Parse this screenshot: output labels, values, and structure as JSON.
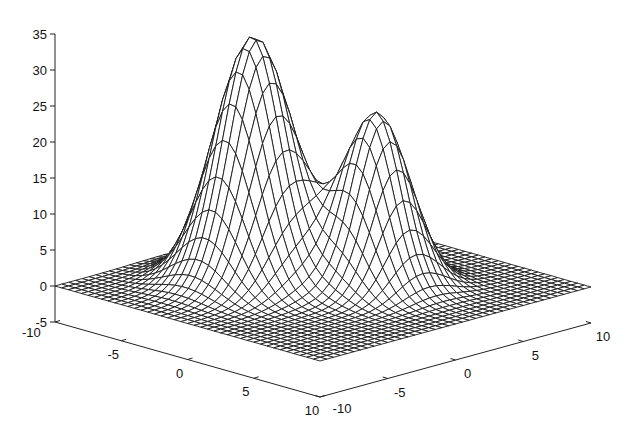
{
  "chart_data": {
    "type": "surface",
    "title": "",
    "xlabel": "",
    "ylabel": "",
    "zlabel": "",
    "x_ticks": [
      "-10",
      "-5",
      "0",
      "5",
      "10"
    ],
    "y_ticks": [
      "-10",
      "-5",
      "0",
      "5",
      "10"
    ],
    "z_ticks": [
      "35",
      "30",
      "25",
      "20",
      "15",
      "10",
      "5",
      "0",
      "-5"
    ],
    "xlim": [
      -10,
      10
    ],
    "ylim": [
      -10,
      10
    ],
    "zlim": [
      -5,
      35
    ],
    "grid": false,
    "style": "wireframe mesh, black lines on white",
    "mesh_resolution": 41,
    "surface": {
      "description": "Sum of two Gaussian peaks on flat zero plane",
      "peaks": [
        {
          "x": -3.3,
          "y": -1.9,
          "height": 34,
          "sigma": 2.1
        },
        {
          "x": 2.0,
          "y": 2.0,
          "height": 24,
          "sigma": 1.8
        }
      ],
      "max_z": 34,
      "min_z": 0
    }
  },
  "colors": {
    "background": "#ffffff",
    "lines": "#1a1a1a"
  }
}
